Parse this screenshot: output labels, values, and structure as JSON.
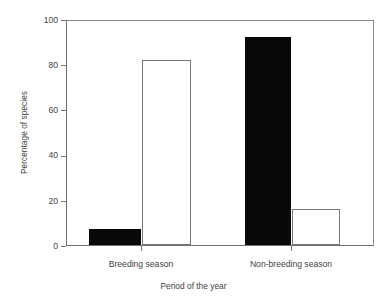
{
  "chart_data": {
    "type": "bar",
    "title": "",
    "xlabel": "Period of the year",
    "ylabel": "Percentage of species",
    "categories": [
      "Breeding season",
      "Non-breeding season"
    ],
    "series": [
      {
        "name": "filled",
        "values": [
          7,
          92
        ]
      },
      {
        "name": "open",
        "values": [
          82,
          16
        ]
      }
    ],
    "ylim": [
      0,
      100
    ],
    "yticks": [
      0,
      20,
      40,
      60,
      80,
      100
    ],
    "ytick_labels": [
      "0",
      "20",
      "40",
      "60",
      "80",
      "100"
    ],
    "grid": false,
    "legend": "none",
    "colors": {
      "filled_bar": "#090909",
      "open_bar_fill": "#ffffff",
      "open_bar_edge": "#777777",
      "axis": "#6f6f6f",
      "text": "#3f3f3f",
      "background": "#ffffff"
    }
  }
}
